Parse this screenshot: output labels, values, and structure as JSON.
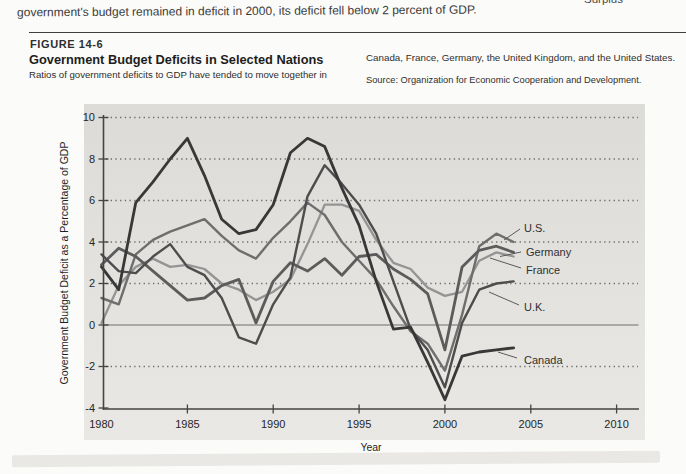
{
  "page": {
    "intro_text": "government's budget remained in deficit in 2000, its deficit fell below 2 percent of GDP.",
    "surplus_fragment": "Surplus"
  },
  "figure": {
    "number": "FIGURE 14-6",
    "title": "Government Budget Deficits in Selected Nations",
    "caption_left": "Ratios of government deficits to GDP have tended to move together in",
    "caption_right": "Canada, France, Germany, the United Kingdom, and the United States.",
    "source": "Source: Organization for Economic Cooperation and Development."
  },
  "chart_data": {
    "type": "line",
    "title": "Government Budget Deficits in Selected Nations",
    "xlabel": "Year",
    "ylabel": "Government Budget Deficit as a Percentage of GDP",
    "xlim": [
      1980,
      2012.3
    ],
    "ylim": [
      -4,
      10
    ],
    "xticks": [
      1980,
      1985,
      1990,
      1995,
      2000,
      2005,
      2010
    ],
    "yticks": [
      10,
      8,
      6,
      4,
      2,
      0,
      -2,
      -4
    ],
    "grid_values": [
      10,
      8,
      6,
      4,
      2,
      -2
    ],
    "grid_style": "dotted",
    "zero_line": 0,
    "legend_position": "end-of-line-labels",
    "panel_color_top": "#dcdbd7",
    "panel_color_bottom": "#e9e8e4",
    "x": [
      1980,
      1981,
      1982,
      1983,
      1984,
      1985,
      1986,
      1987,
      1988,
      1989,
      1990,
      1991,
      1992,
      1993,
      1994,
      1995,
      1996,
      1997,
      1998,
      1999,
      2000,
      2001,
      2002,
      2003,
      2004
    ],
    "series": [
      {
        "name": "France",
        "color": "#949494",
        "width": 2.3,
        "values": [
          0.1,
          1.9,
          2.8,
          3.2,
          2.8,
          2.9,
          2.7,
          2.0,
          1.7,
          1.2,
          1.6,
          2.2,
          3.9,
          5.8,
          5.8,
          5.5,
          4.1,
          3.0,
          2.7,
          1.8,
          1.4,
          1.6,
          3.1,
          3.5,
          3.3
        ]
      },
      {
        "name": "U.S.",
        "color": "#6e6e6e",
        "width": 2.4,
        "values": [
          1.3,
          1.0,
          3.4,
          4.1,
          4.5,
          4.8,
          5.1,
          4.3,
          3.6,
          3.2,
          4.2,
          5.0,
          5.9,
          5.3,
          4.0,
          3.1,
          2.2,
          0.9,
          -0.3,
          -0.9,
          -2.2,
          0.5,
          3.8,
          4.4,
          4.0
        ]
      },
      {
        "name": "Germany",
        "color": "#5c5c5c",
        "width": 2.8,
        "values": [
          2.9,
          3.7,
          3.3,
          2.6,
          1.9,
          1.2,
          1.3,
          1.9,
          2.2,
          0.1,
          2.1,
          3.0,
          2.6,
          3.2,
          2.4,
          3.3,
          3.4,
          2.7,
          2.2,
          1.5,
          -1.2,
          2.8,
          3.6,
          3.8,
          3.5
        ]
      },
      {
        "name": "U.K.",
        "color": "#4d4d4d",
        "width": 2.4,
        "values": [
          3.4,
          2.6,
          2.5,
          3.3,
          3.9,
          2.8,
          2.4,
          1.3,
          -0.6,
          -0.9,
          1.0,
          2.3,
          6.2,
          7.7,
          6.8,
          5.8,
          4.4,
          2.1,
          -0.2,
          -1.2,
          -3.0,
          0.1,
          1.7,
          2.0,
          2.1
        ]
      },
      {
        "name": "Canada",
        "color": "#383838",
        "width": 2.8,
        "values": [
          2.8,
          1.7,
          5.9,
          6.9,
          8.0,
          9.0,
          7.2,
          5.1,
          4.4,
          4.6,
          5.8,
          8.3,
          9.0,
          8.6,
          6.6,
          4.8,
          2.1,
          -0.2,
          -0.1,
          -1.8,
          -3.6,
          -1.5,
          -1.3,
          -1.2,
          -1.1
        ]
      }
    ]
  }
}
